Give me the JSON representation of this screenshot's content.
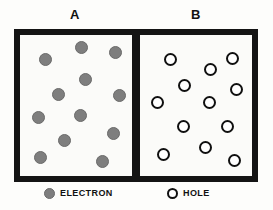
{
  "figure": {
    "background_color": "#fdfdfb",
    "ink_color": "#141414"
  },
  "panels": [
    {
      "id": "a",
      "label": "A",
      "particle_kind": "electron",
      "particle_count": 12,
      "particles": [
        {
          "x": 45,
          "y": 59
        },
        {
          "x": 81,
          "y": 47
        },
        {
          "x": 115,
          "y": 52
        },
        {
          "x": 85,
          "y": 79
        },
        {
          "x": 58,
          "y": 94
        },
        {
          "x": 119,
          "y": 95
        },
        {
          "x": 38,
          "y": 117
        },
        {
          "x": 80,
          "y": 115
        },
        {
          "x": 64,
          "y": 140
        },
        {
          "x": 113,
          "y": 133
        },
        {
          "x": 40,
          "y": 157
        },
        {
          "x": 102,
          "y": 161
        }
      ]
    },
    {
      "id": "b",
      "label": "B",
      "particle_kind": "hole",
      "particle_count": 12,
      "particles": [
        {
          "x": 170,
          "y": 59
        },
        {
          "x": 210,
          "y": 69
        },
        {
          "x": 232,
          "y": 58
        },
        {
          "x": 184,
          "y": 85
        },
        {
          "x": 236,
          "y": 89
        },
        {
          "x": 157,
          "y": 102
        },
        {
          "x": 209,
          "y": 102
        },
        {
          "x": 183,
          "y": 126
        },
        {
          "x": 227,
          "y": 126
        },
        {
          "x": 205,
          "y": 147
        },
        {
          "x": 163,
          "y": 154
        },
        {
          "x": 234,
          "y": 160
        }
      ]
    }
  ],
  "legend": {
    "items": [
      {
        "symbol": "filled-circle",
        "label": "ELECTRON",
        "color": "#7e7e7e"
      },
      {
        "symbol": "open-circle",
        "label": "HOLE",
        "color": "#ffffff"
      }
    ]
  }
}
